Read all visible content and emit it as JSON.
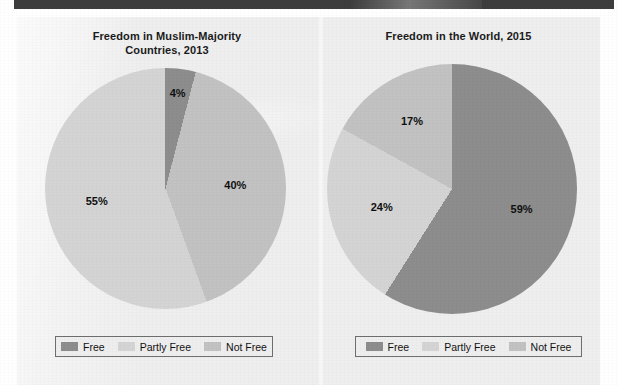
{
  "colors": {
    "free": "#8d8d8d",
    "partly_free": "#d4d4d4",
    "not_free": "#c2c2c2",
    "page_background": "#e9e9e9",
    "top_band": "#3d3d3d",
    "legend_border": "#6f6f6f",
    "text": "#101010"
  },
  "legend": {
    "items": [
      {
        "label": "Free",
        "color_key": "free"
      },
      {
        "label": "Partly Free",
        "color_key": "partly_free"
      },
      {
        "label": "Not Free",
        "color_key": "not_free"
      }
    ]
  },
  "charts": [
    {
      "title_line1": "Freedom in Muslim-Majority",
      "title_line2": "Countries, 2013",
      "labels": {
        "free": "4%",
        "partly_free": "40%",
        "not_free": "55%"
      },
      "legend": [
        {
          "label": "Free"
        },
        {
          "label": "Partly Free"
        },
        {
          "label": "Not Free"
        }
      ]
    },
    {
      "title_line1": "Freedom in the World, 2015",
      "title_line2": "",
      "labels": {
        "free": "59%",
        "partly_free": "24%",
        "not_free": "17%"
      },
      "legend": [
        {
          "label": "Free"
        },
        {
          "label": "Partly Free"
        },
        {
          "label": "Not Free"
        }
      ]
    }
  ],
  "chart_data": [
    {
      "type": "pie",
      "title": "Freedom in Muslim-Majority Countries, 2013",
      "categories": [
        "Free",
        "Partly Free",
        "Not Free"
      ],
      "values": [
        4,
        40,
        55
      ],
      "value_labels": [
        "4%",
        "40%",
        "55%"
      ],
      "units": "percent",
      "colors": [
        "#8d8d8d",
        "#c2c2c2",
        "#d4d4d4"
      ],
      "legend_position": "bottom",
      "start_angle_deg": 0,
      "direction": "clockwise",
      "grid": false,
      "notes": "Slices drawn clockwise from 12 o'clock: Free 4%, Partly Free 40%, Not Free 55%. Labels shown inside slices."
    },
    {
      "type": "pie",
      "title": "Freedom in the World, 2015",
      "categories": [
        "Free",
        "Partly Free",
        "Not Free"
      ],
      "values": [
        59,
        24,
        17
      ],
      "value_labels": [
        "59%",
        "24%",
        "17%"
      ],
      "units": "percent",
      "colors": [
        "#8d8d8d",
        "#d4d4d4",
        "#c2c2c2"
      ],
      "legend_position": "bottom",
      "start_angle_deg": 0,
      "direction": "clockwise",
      "grid": false,
      "notes": "Slices drawn clockwise from 12 o'clock: Free 59%, Partly Free 24%, Not Free 17%. Labels shown inside slices."
    }
  ]
}
